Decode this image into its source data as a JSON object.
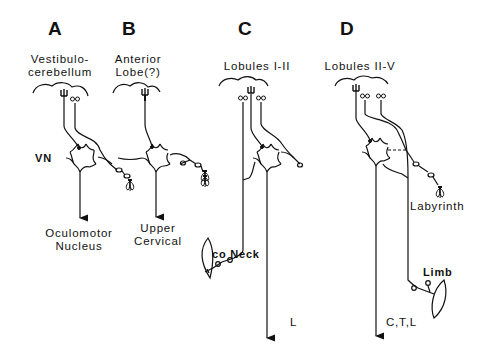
{
  "panels": [
    {
      "letter": "A",
      "source": [
        "Vestibulo-",
        "cerebellum"
      ],
      "nucleus_label": "VN",
      "target": [
        "Oculomotor",
        "Nucleus"
      ]
    },
    {
      "letter": "B",
      "source": [
        "Anterior",
        "Lobe(?)"
      ],
      "target": [
        "Upper",
        "Cervical"
      ]
    },
    {
      "letter": "C",
      "source": [
        "Lobules I-II"
      ],
      "afferent_label": "co Neck",
      "target": [
        "L"
      ]
    },
    {
      "letter": "D",
      "source": [
        "Lobules II-V"
      ],
      "afferent_labels": [
        "Labyrinth",
        "Limb"
      ],
      "target": [
        "C,T,L"
      ]
    }
  ],
  "colors": {
    "ink": "#111111",
    "background": "#ffffff"
  }
}
